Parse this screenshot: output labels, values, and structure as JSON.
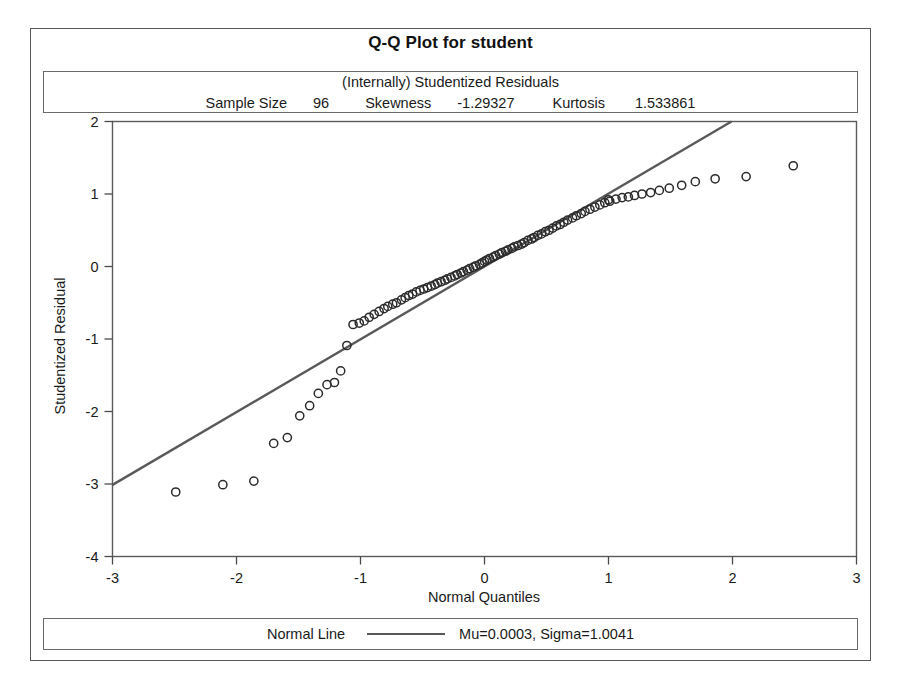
{
  "title": "Q-Q Plot for student",
  "stats": {
    "subtitle": "(Internally) Studentized Residuals",
    "sample_size_label": "Sample Size",
    "sample_size_value": "96",
    "skewness_label": "Skewness",
    "skewness_value": "-1.29327",
    "kurtosis_label": "Kurtosis",
    "kurtosis_value": "1.533861"
  },
  "legend": {
    "series_label": "Normal Line",
    "params": "Mu=0.0003, Sigma=1.0041"
  },
  "colors": {
    "line": "#595959",
    "marker": "#2b2b2b",
    "axis": "#4a4a4a",
    "frame": "#5a5a5a",
    "background": "#ffffff"
  },
  "chart_data": {
    "type": "scatter",
    "title": "Q-Q Plot for student",
    "subtitle": "(Internally) Studentized Residuals",
    "xlabel": "Normal Quantiles",
    "ylabel": "Studentized Residual",
    "xlim": [
      -3,
      3
    ],
    "ylim": [
      -4,
      2
    ],
    "xticks": [
      -3,
      -2,
      -1,
      0,
      1,
      2,
      3
    ],
    "yticks": [
      -4,
      -3,
      -2,
      -1,
      0,
      1,
      2
    ],
    "grid": false,
    "legend_position": "bottom",
    "sample_size": 96,
    "skewness": -1.29327,
    "kurtosis": 1.533861,
    "reference_line": {
      "name": "Normal Line",
      "mu": 0.0003,
      "sigma": 1.0041,
      "slope": 1.0041,
      "intercept": 0.0003,
      "x_from": -3.0,
      "x_to": 2.0,
      "color": "#595959"
    },
    "series": [
      {
        "name": "Studentized residuals",
        "marker": "open-circle",
        "x": [
          -2.49,
          -2.11,
          -1.86,
          -1.7,
          -1.59,
          -1.49,
          -1.41,
          -1.34,
          -1.27,
          -1.21,
          -1.16,
          -1.11,
          -1.06,
          -1.01,
          -0.97,
          -0.93,
          -0.89,
          -0.85,
          -0.81,
          -0.78,
          -0.74,
          -0.71,
          -0.67,
          -0.64,
          -0.61,
          -0.58,
          -0.55,
          -0.52,
          -0.49,
          -0.46,
          -0.43,
          -0.4,
          -0.38,
          -0.35,
          -0.32,
          -0.3,
          -0.27,
          -0.24,
          -0.22,
          -0.19,
          -0.17,
          -0.14,
          -0.12,
          -0.09,
          -0.07,
          -0.04,
          -0.02,
          0.0,
          0.02,
          0.04,
          0.07,
          0.09,
          0.12,
          0.14,
          0.17,
          0.19,
          0.22,
          0.24,
          0.27,
          0.3,
          0.32,
          0.35,
          0.38,
          0.4,
          0.43,
          0.46,
          0.49,
          0.52,
          0.55,
          0.58,
          0.61,
          0.64,
          0.67,
          0.71,
          0.74,
          0.78,
          0.81,
          0.85,
          0.89,
          0.93,
          0.97,
          1.01,
          1.06,
          1.11,
          1.16,
          1.21,
          1.27,
          1.34,
          1.41,
          1.49,
          1.59,
          1.7,
          1.86,
          2.11,
          2.49,
          1.0
        ],
        "y": [
          -3.11,
          -3.01,
          -2.96,
          -2.44,
          -2.36,
          -2.06,
          -1.92,
          -1.75,
          -1.63,
          -1.6,
          -1.44,
          -1.09,
          -0.8,
          -0.78,
          -0.75,
          -0.7,
          -0.66,
          -0.62,
          -0.58,
          -0.55,
          -0.52,
          -0.5,
          -0.46,
          -0.43,
          -0.4,
          -0.38,
          -0.35,
          -0.33,
          -0.31,
          -0.29,
          -0.27,
          -0.25,
          -0.23,
          -0.21,
          -0.19,
          -0.17,
          -0.15,
          -0.13,
          -0.11,
          -0.09,
          -0.07,
          -0.05,
          -0.03,
          -0.01,
          0.01,
          0.03,
          0.05,
          0.07,
          0.09,
          0.11,
          0.13,
          0.15,
          0.17,
          0.19,
          0.21,
          0.23,
          0.25,
          0.27,
          0.29,
          0.31,
          0.33,
          0.36,
          0.38,
          0.4,
          0.43,
          0.45,
          0.48,
          0.5,
          0.53,
          0.56,
          0.58,
          0.61,
          0.64,
          0.67,
          0.7,
          0.73,
          0.76,
          0.79,
          0.82,
          0.85,
          0.88,
          0.9,
          0.93,
          0.95,
          0.96,
          0.98,
          1.0,
          1.02,
          1.05,
          1.08,
          1.12,
          1.17,
          1.21,
          1.24,
          1.39,
          0.92
        ]
      }
    ]
  }
}
